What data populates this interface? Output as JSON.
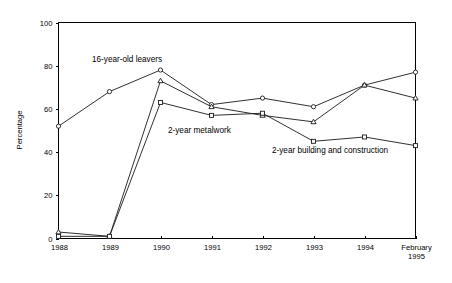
{
  "chart_data": {
    "type": "line",
    "title": "",
    "subtitle": "",
    "xlabel": "",
    "ylabel": "Percentage",
    "ylim": [
      0,
      100
    ],
    "yticks": [
      0,
      20,
      40,
      60,
      80,
      100
    ],
    "ytick_labels": [
      "0",
      "20",
      "40",
      "60",
      "80",
      "100"
    ],
    "grid": false,
    "legend_position": "inline-annotations",
    "categories": [
      "1988",
      "1989",
      "1990",
      "1991",
      "1992",
      "1993",
      "1994",
      "February\n1995"
    ],
    "xtick_labels": [
      "1988",
      "1989",
      "1990",
      "1991",
      "1992",
      "1993",
      "1994",
      "February",
      "1995"
    ],
    "last_category_line1": "February",
    "last_category_line2": "1995",
    "series": [
      {
        "name": "16-year-old leavers",
        "marker": "circle",
        "values": [
          52,
          68,
          78,
          62,
          65,
          61,
          71,
          77
        ]
      },
      {
        "name": "2-year metalwork",
        "marker": "triangle",
        "values": [
          3,
          1,
          73,
          61,
          57,
          54,
          71,
          65
        ]
      },
      {
        "name": "2-year building and construction",
        "marker": "square",
        "values": [
          1,
          1,
          63,
          57,
          58,
          45,
          47,
          43
        ]
      }
    ],
    "annotations": [
      {
        "text": "16-year-old leavers",
        "x_px": 92,
        "y_px": 62
      },
      {
        "text": "2-year metalwork",
        "x_px": 168,
        "y_px": 133
      },
      {
        "text": "2-year building and construction",
        "x_px": 272,
        "y_px": 153
      }
    ],
    "colors": {
      "axis": "#000000",
      "line": "#1a1a1a",
      "marker_fill": "#ffffff",
      "background": "#ffffff"
    }
  }
}
